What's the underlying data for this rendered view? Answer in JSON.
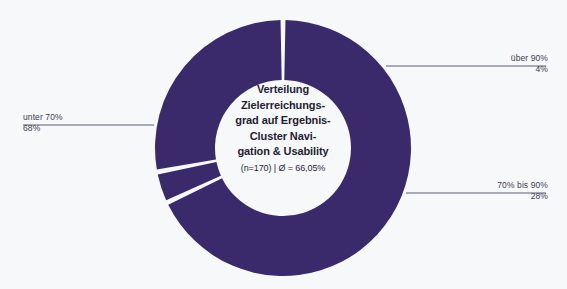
{
  "chart_data": {
    "type": "pie",
    "variant": "donut",
    "subtitle": "(n=170) | Ø = 66,05%",
    "categories": [
      "unter 70%",
      "über 90%",
      "70% bis 90%"
    ],
    "values": [
      68,
      4,
      28
    ],
    "value_labels": [
      "68%",
      "4%",
      "28%"
    ],
    "unit": "%",
    "sample_size": "n=170",
    "mean": "Ø = 66,05%",
    "legend": "none",
    "grid": false,
    "colors": {
      "slice": "#3b2a6b",
      "gap": "#f7f8fa",
      "leader_line": "#4a4a6a",
      "label_text": "#3c3c50",
      "center_text": "#241c33",
      "background": "#f7f8fa"
    },
    "geometry": {
      "center_x": 283,
      "center_y": 148,
      "outer_radius": 128,
      "inner_radius": 68,
      "start_angle_deg": -90,
      "gap_deg": 2.2
    }
  },
  "center_label": {
    "lines": [
      "Verteilung",
      "Zielerreichungs-",
      "grad auf Ergebnis-",
      "Cluster Navi-",
      "gation & Usability"
    ],
    "subtitle": "(n=170) | Ø = 66,05%"
  },
  "callouts": {
    "ueber90": {
      "category": "über 90%",
      "value": "4%"
    },
    "bis90": {
      "category": "70% bis 90%",
      "value": "28%"
    },
    "unter70": {
      "category": "unter 70%",
      "value": "68%"
    }
  }
}
